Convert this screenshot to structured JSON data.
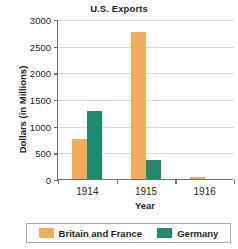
{
  "chart_data": {
    "type": "bar",
    "title": "U.S. Exports",
    "xlabel": "Year",
    "ylabel": "Dollars (in Millions)",
    "categories": [
      "1914",
      "1915",
      "1916"
    ],
    "series": [
      {
        "name": "Britain and France",
        "color": "#f0ad5e",
        "values": [
          750,
          2750,
          30
        ]
      },
      {
        "name": "Germany",
        "color": "#1e8a6e",
        "values": [
          1280,
          350,
          0
        ]
      }
    ],
    "ylim": [
      0,
      3000
    ],
    "ytick_labels": [
      "0",
      "500",
      "1000",
      "1500",
      "2000",
      "2500",
      "3000"
    ],
    "ytick_values": [
      0,
      500,
      1000,
      1500,
      2000,
      2500,
      3000
    ],
    "grid": true,
    "legend_position": "bottom"
  }
}
